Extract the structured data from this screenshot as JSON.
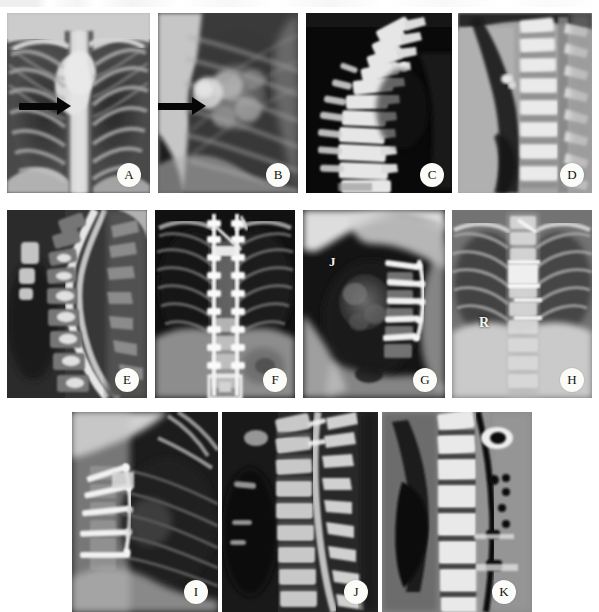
{
  "figure": {
    "kind": "radiographic-panel-montage",
    "panel_count": 11,
    "rows": 3,
    "background_color": "#ffffff",
    "label_background_color": "#fbfbf8",
    "label_text_color": "#111111"
  },
  "panels": [
    {
      "id": "A",
      "label": "A",
      "modality": "radiograph",
      "view": "chest-posteroanterior",
      "description": "Frontal chest radiograph showing ribs, lung fields and mediastinum with a black arrow pointing to a right paramediastinal lesion",
      "row": 1,
      "column": 1,
      "x": 7,
      "y": 13,
      "width": 143,
      "height": 180,
      "annotations": [
        {
          "type": "arrow",
          "direction": "right",
          "target": "right paramediastinal opacity"
        }
      ]
    },
    {
      "id": "B",
      "label": "B",
      "modality": "radiograph",
      "view": "chest-lateral",
      "description": "Lateral chest radiograph with a black arrow pointing to a posterior mediastinal / vertebral lesion",
      "row": 1,
      "column": 2,
      "x": 158,
      "y": 13,
      "width": 140,
      "height": 180,
      "annotations": [
        {
          "type": "arrow",
          "direction": "right",
          "target": "posterior mediastinal lesion"
        }
      ]
    },
    {
      "id": "C",
      "label": "C",
      "modality": "ct",
      "view": "sagittal-reconstruction-bone-window",
      "description": "Sagittal CT bone reconstruction of the thoracic spine showing vertebral bodies in profile against a black background",
      "row": 1,
      "column": 3,
      "x": 306,
      "y": 13,
      "width": 146,
      "height": 180,
      "annotations": []
    },
    {
      "id": "D",
      "label": "D",
      "modality": "ct",
      "view": "sagittal-soft-tissue-window",
      "description": "Sagittal CT soft tissue window of the thoracic spine with paraspinal soft tissue mass",
      "row": 1,
      "column": 4,
      "x": 458,
      "y": 13,
      "width": 134,
      "height": 180,
      "annotations": []
    },
    {
      "id": "E",
      "label": "E",
      "modality": "mri",
      "view": "sagittal-t2",
      "description": "Sagittal T2-weighted MRI of the cervicothoracic spine showing the bright spinal canal CSF column and vertebral bodies",
      "row": 2,
      "column": 1,
      "x": 7,
      "y": 210,
      "width": 140,
      "height": 188,
      "annotations": []
    },
    {
      "id": "F",
      "label": "F",
      "modality": "radiograph",
      "view": "spine-anteroposterior-postoperative",
      "description": "Frontal radiograph after posterior instrumentation showing pedicle screws and longitudinal rods spanning the thoracolumbar spine",
      "row": 2,
      "column": 2,
      "x": 155,
      "y": 210,
      "width": 140,
      "height": 188,
      "annotations": []
    },
    {
      "id": "G",
      "label": "G",
      "modality": "radiograph",
      "view": "chest-lateral-postoperative",
      "description": "Lateral chest radiograph after anterior instrumentation with screws and rod, marked with a metallic J marker",
      "row": 2,
      "column": 3,
      "x": 303,
      "y": 210,
      "width": 142,
      "height": 188,
      "annotations": [
        {
          "type": "marker",
          "text": "J",
          "meaning": "radiopaque side marker"
        }
      ]
    },
    {
      "id": "H",
      "label": "H",
      "modality": "radiograph",
      "view": "chest-anteroposterior-postoperative",
      "description": "Frontal chest radiograph after anterior spinal reconstruction with a vertebral body cage, marked R for right side",
      "row": 2,
      "column": 4,
      "x": 452,
      "y": 210,
      "width": 140,
      "height": 188,
      "annotations": [
        {
          "type": "marker",
          "text": "R",
          "meaning": "right side marker"
        }
      ]
    },
    {
      "id": "I",
      "label": "I",
      "modality": "radiograph",
      "view": "chest-lateral-postoperative",
      "description": "Lateral chest radiograph showing anterior vertebral body screws and a plate construct",
      "row": 3,
      "column": 1,
      "x": 72,
      "y": 412,
      "width": 146,
      "height": 200,
      "annotations": []
    },
    {
      "id": "J",
      "label": "J",
      "modality": "mri",
      "view": "sagittal-t1-postcontrast",
      "description": "Sagittal MRI of the thoracic spine after instrumentation showing vertebral bodies and the spinal canal",
      "row": 3,
      "column": 2,
      "x": 222,
      "y": 412,
      "width": 156,
      "height": 200,
      "annotations": []
    },
    {
      "id": "K",
      "label": "K",
      "modality": "ct",
      "view": "sagittal-reconstruction",
      "description": "Sagittal CT reconstruction of the thoracic spine showing the implant rod and screw heads as dark metallic artifacts",
      "row": 3,
      "column": 3,
      "x": 382,
      "y": 412,
      "width": 150,
      "height": 200,
      "annotations": []
    }
  ]
}
